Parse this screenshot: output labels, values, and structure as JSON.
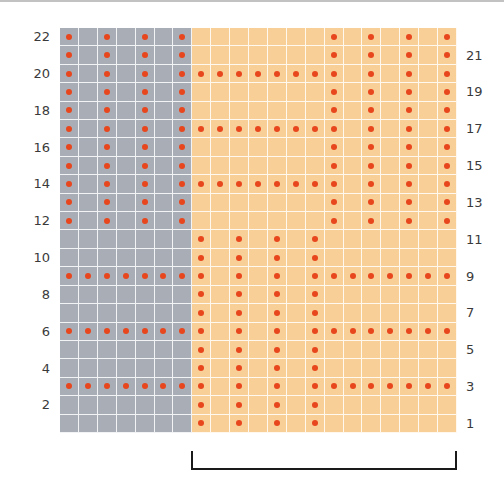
{
  "chart_title": "",
  "colors": {
    "gray_panel": "#a9aeb6",
    "orange_panel": "#f8cf96",
    "dot": "#e8461d",
    "grid_line": "#ffffff",
    "bracket": "#1a1a1a"
  },
  "grid": {
    "columns": 21,
    "rows": 22,
    "gray_columns": [
      1,
      7
    ],
    "orange_columns": [
      8,
      21
    ],
    "legend": {
      "dot": "purl stitch (knit on WS)",
      "blank": "knit stitch"
    },
    "rows_top_to_bottom": [
      {
        "row": 22,
        "pattern": "X.X.X.X.......X.X.X.X"
      },
      {
        "row": 21,
        "pattern": "X.X.X.X.......X.X.X.X"
      },
      {
        "row": 20,
        "pattern": "X.X.X.XXXXXXXXX.X.X.X"
      },
      {
        "row": 19,
        "pattern": "X.X.X.X.......X.X.X.X"
      },
      {
        "row": 18,
        "pattern": "X.X.X.X.......X.X.X.X"
      },
      {
        "row": 17,
        "pattern": "X.X.X.XXXXXXXXX.X.X.X"
      },
      {
        "row": 16,
        "pattern": "X.X.X.X.......X.X.X.X"
      },
      {
        "row": 15,
        "pattern": "X.X.X.X.......X.X.X.X"
      },
      {
        "row": 14,
        "pattern": "X.X.X.XXXXXXXXX.X.X.X"
      },
      {
        "row": 13,
        "pattern": "X.X.X.X.......X.X.X.X"
      },
      {
        "row": 12,
        "pattern": "X.X.X.X.......X.X.X.X"
      },
      {
        "row": 11,
        "pattern": ".......X.X.X.X......."
      },
      {
        "row": 10,
        "pattern": ".......X.X.X.X......."
      },
      {
        "row": 9,
        "pattern": "XXXXXXXX.X.X.XXXXXXXX"
      },
      {
        "row": 8,
        "pattern": ".......X.X.X.X......."
      },
      {
        "row": 7,
        "pattern": ".......X.X.X.X......."
      },
      {
        "row": 6,
        "pattern": "XXXXXXXX.X.X.XXXXXXXX"
      },
      {
        "row": 5,
        "pattern": ".......X.X.X.X......."
      },
      {
        "row": 4,
        "pattern": ".......X.X.X.X......."
      },
      {
        "row": 3,
        "pattern": "XXXXXXXX.X.X.XXXXXXXX"
      },
      {
        "row": 2,
        "pattern": ".......X.X.X.X......."
      },
      {
        "row": 1,
        "pattern": ".......X.X.X.X......."
      }
    ]
  },
  "labels": {
    "left": [
      "22",
      "20",
      "18",
      "16",
      "14",
      "12",
      "10",
      "8",
      "6",
      "4",
      "2"
    ],
    "right": [
      "21",
      "19",
      "17",
      "15",
      "13",
      "11",
      "9",
      "7",
      "5",
      "3",
      "1"
    ]
  },
  "bracket": {
    "label": "",
    "from_column": 8,
    "to_column": 21,
    "meaning": "pattern repeat"
  }
}
